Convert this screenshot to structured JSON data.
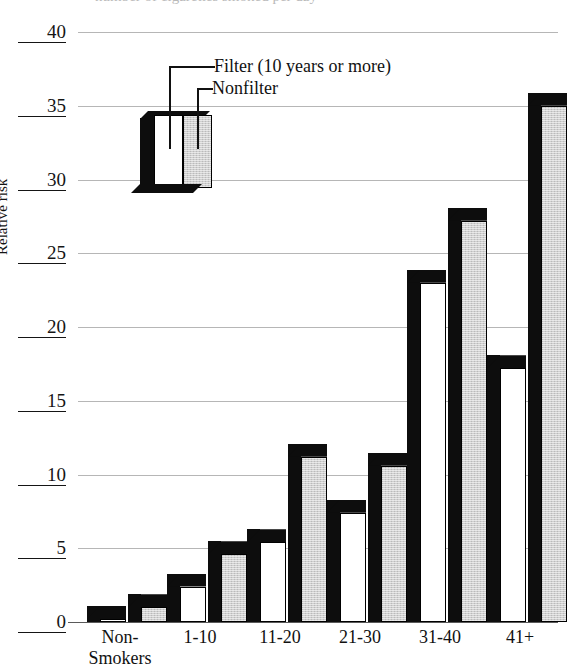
{
  "chart_data": {
    "type": "bar",
    "title": "",
    "xlabel": "",
    "ylabel": "Relative risk",
    "ylim": [
      0,
      40
    ],
    "yticks": [
      0,
      5,
      10,
      15,
      20,
      25,
      30,
      35,
      40
    ],
    "grid": true,
    "legend_position": "inside-upper-left",
    "categories": [
      "Non-\nSmokers",
      "1-10",
      "11-20",
      "21-30",
      "31-40",
      "41+"
    ],
    "series": [
      {
        "name": "Filter (10 years or more)",
        "color": "#ffffff",
        "values": [
          0.2,
          2.4,
          5.4,
          7.4,
          23.0,
          17.2
        ]
      },
      {
        "name": "Nonfilter",
        "color": "#cfcfcf",
        "values": [
          1.0,
          4.6,
          11.2,
          10.6,
          27.2,
          35.0
        ]
      }
    ]
  },
  "axis": {
    "y_label": "Relative risk",
    "y_ticks": [
      "0",
      "5",
      "10",
      "15",
      "20",
      "25",
      "30",
      "35",
      "40"
    ],
    "x_ticks": [
      "Non-\nSmokers",
      "1-10",
      "11-20",
      "21-30",
      "31-40",
      "41+"
    ]
  },
  "legend": {
    "filter_label": "Filter (10 years or more)",
    "nonfilter_label": "Nonfilter"
  },
  "top_crop": {
    "text": "number of cigarettes smoked per day"
  }
}
